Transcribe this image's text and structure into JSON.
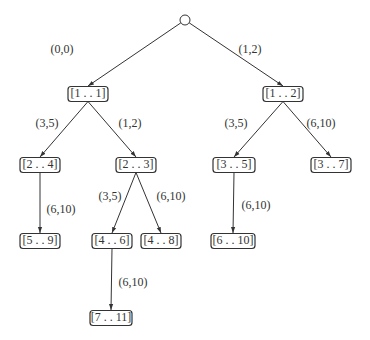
{
  "diagram": {
    "type": "tree",
    "root": {
      "id": "root",
      "label": "",
      "shape": "circle",
      "x": 185,
      "y": 20
    },
    "nodes": [
      {
        "id": "n11",
        "label": "[1 . . 1]",
        "x": 88,
        "y": 94,
        "w": 40
      },
      {
        "id": "n12",
        "label": "[1 . . 2]",
        "x": 283,
        "y": 94,
        "w": 40
      },
      {
        "id": "n24",
        "label": "[2 . . 4]",
        "x": 40,
        "y": 165,
        "w": 40
      },
      {
        "id": "n23",
        "label": "[2 . . 3]",
        "x": 136,
        "y": 165,
        "w": 40
      },
      {
        "id": "n35",
        "label": "[3 . . 5]",
        "x": 234,
        "y": 165,
        "w": 42
      },
      {
        "id": "n37",
        "label": "[3 . . 7]",
        "x": 331,
        "y": 165,
        "w": 40
      },
      {
        "id": "n59",
        "label": "[5 . . 9]",
        "x": 40,
        "y": 241,
        "w": 40
      },
      {
        "id": "n46",
        "label": "[4 . . 6]",
        "x": 112,
        "y": 241,
        "w": 40
      },
      {
        "id": "n48",
        "label": "[4 . . 8]",
        "x": 161,
        "y": 241,
        "w": 40
      },
      {
        "id": "n610",
        "label": "[6 . . 10]",
        "x": 233,
        "y": 241,
        "w": 44
      },
      {
        "id": "n711",
        "label": "[7 . . 11]",
        "x": 111,
        "y": 318,
        "w": 42
      }
    ],
    "edges": [
      {
        "from": "root",
        "to": "n11",
        "label": "(0,0)",
        "lx": 62,
        "ly": 50
      },
      {
        "from": "root",
        "to": "n12",
        "label": "(1,2)",
        "lx": 250,
        "ly": 50
      },
      {
        "from": "n11",
        "to": "n24",
        "label": "(3,5)",
        "lx": 47,
        "ly": 124
      },
      {
        "from": "n11",
        "to": "n23",
        "label": "(1,2)",
        "lx": 130,
        "ly": 124
      },
      {
        "from": "n12",
        "to": "n35",
        "label": "(3,5)",
        "lx": 236,
        "ly": 124
      },
      {
        "from": "n12",
        "to": "n37",
        "label": "(6,10)",
        "lx": 321,
        "ly": 124
      },
      {
        "from": "n24",
        "to": "n59",
        "label": "(6,10)",
        "lx": 61,
        "ly": 210
      },
      {
        "from": "n23",
        "to": "n46",
        "label": "(3,5)",
        "lx": 110,
        "ly": 197
      },
      {
        "from": "n23",
        "to": "n48",
        "label": "(6,10)",
        "lx": 171,
        "ly": 197
      },
      {
        "from": "n35",
        "to": "n610",
        "label": "(6,10)",
        "lx": 256,
        "ly": 206
      },
      {
        "from": "n46",
        "to": "n711",
        "label": "(6,10)",
        "lx": 133,
        "ly": 283
      }
    ]
  }
}
